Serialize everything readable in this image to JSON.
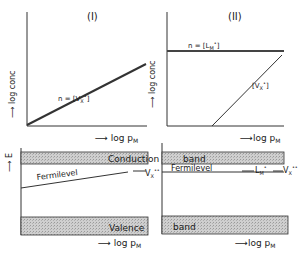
{
  "figure": {
    "panels": [
      {
        "id": "I",
        "title": "(I)",
        "top": {
          "ylabel": "log conc",
          "xlabel": "log p",
          "xlabel_sub": "M",
          "curves": [
            {
              "label": "n = [V",
              "label_sub": "X",
              "label_sup": "•",
              "label_close": "]",
              "type": "rising line"
            }
          ]
        },
        "bottom": {
          "ylabel": "E",
          "xlabel": "log p",
          "xlabel_sub": "M",
          "bands": {
            "conduction": "Conduction",
            "valence": "Valence"
          },
          "fermi_label": "Fermilevel",
          "level_label": "V",
          "level_sub": "X",
          "level_sup": "••"
        }
      },
      {
        "id": "II",
        "title": "(II)",
        "top": {
          "ylabel": "log conc",
          "xlabel": "log p",
          "xlabel_sub": "M",
          "curves": [
            {
              "label": "n = [L",
              "label_sub": "M",
              "label_sup": "•",
              "label_close": "]",
              "type": "constant line"
            },
            {
              "label": "[V",
              "label_sub": "X",
              "label_sup": "•",
              "label_close": "]",
              "type": "rising line"
            }
          ]
        },
        "bottom": {
          "ylabel": "",
          "xlabel": "log p",
          "xlabel_sub": "M",
          "bands": {
            "conduction": "band",
            "valence": "band"
          },
          "fermi_label": "Fermilevel",
          "level1_label": "L",
          "level1_sub": "M",
          "level1_sup": "•",
          "level2_label": "V",
          "level2_sub": "X",
          "level2_sup": "••"
        }
      }
    ],
    "colors": {
      "ink": "#1a1a1a",
      "band_fill": "#c4c4c4",
      "line": "#444444"
    }
  }
}
